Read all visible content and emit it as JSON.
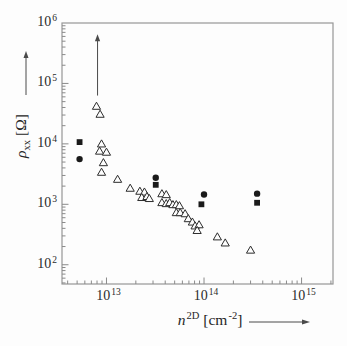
{
  "labels": {
    "ten": "10",
    "y_title_symbol": "ρ",
    "y_title_sub": "xx",
    "y_title_unit": "[Ω]",
    "x_title_symbol": "n",
    "x_title_sup": "2D",
    "x_title_unit_open": "[cm",
    "x_title_unit_exp": "-2",
    "x_title_unit_close": "]"
  },
  "y_axis": {
    "tick_exponents": [
      6,
      5,
      4,
      3,
      2
    ]
  },
  "x_axis": {
    "tick_exponents": [
      13,
      14,
      15
    ]
  },
  "colors": {
    "background": "#fdfdfd",
    "frame": "#979797",
    "tick": "#8a8a8a",
    "marker": "#1a1a1a",
    "triangle_stroke": "#2c2c2c",
    "arrow": "#4a4a4a",
    "text": "#2b2b2b"
  },
  "chart_data": {
    "type": "scatter",
    "x_scale": "log",
    "y_scale": "log",
    "xlabel": "n^2D [cm^-2]",
    "ylabel": "rho_xx [Ohm]",
    "xlim": [
      3500000000000.0,
      2100000000000000.0
    ],
    "ylim": [
      48,
      1000000
    ],
    "x_major_ticks": [
      10000000000000.0,
      100000000000000.0,
      1000000000000000.0
    ],
    "y_major_ticks": [
      100,
      1000,
      10000,
      100000,
      1000000
    ],
    "grid": false,
    "legend": false,
    "series": [
      {
        "name": "open-triangles",
        "marker": "triangle-open",
        "points": [
          [
            7900000000000.0,
            42000
          ],
          [
            8600000000000.0,
            31000
          ],
          [
            8900000000000.0,
            10000
          ],
          [
            8500000000000.0,
            7600
          ],
          [
            10000000000000.0,
            7300
          ],
          [
            9300000000000.0,
            4900
          ],
          [
            8900000000000.0,
            3400
          ],
          [
            13000000000000.0,
            2600
          ],
          [
            17500000000000.0,
            1850
          ],
          [
            22000000000000.0,
            1650
          ],
          [
            24500000000000.0,
            1600
          ],
          [
            23000000000000.0,
            1300
          ],
          [
            26000000000000.0,
            1350
          ],
          [
            27500000000000.0,
            1250
          ],
          [
            37000000000000.0,
            1500
          ],
          [
            41000000000000.0,
            1450
          ],
          [
            37000000000000.0,
            1070
          ],
          [
            41000000000000.0,
            1030
          ],
          [
            44500000000000.0,
            1070
          ],
          [
            48000000000000.0,
            990
          ],
          [
            52000000000000.0,
            990
          ],
          [
            56000000000000.0,
            950
          ],
          [
            52000000000000.0,
            730
          ],
          [
            57000000000000.0,
            730
          ],
          [
            64000000000000.0,
            700
          ],
          [
            69000000000000.0,
            580
          ],
          [
            76000000000000.0,
            510
          ],
          [
            81000000000000.0,
            440
          ],
          [
            89000000000000.0,
            460
          ],
          [
            85000000000000.0,
            370
          ],
          [
            137000000000000.0,
            290
          ],
          [
            165000000000000.0,
            230
          ],
          [
            300000000000000.0,
            175
          ]
        ]
      },
      {
        "name": "filled-circles",
        "marker": "circle-filled",
        "points": [
          [
            5300000000000.0,
            5600
          ],
          [
            32000000000000.0,
            2750
          ],
          [
            100000000000000.0,
            1450
          ],
          [
            350000000000000.0,
            1500
          ]
        ]
      },
      {
        "name": "filled-squares",
        "marker": "square-filled",
        "points": [
          [
            5300000000000.0,
            10700
          ],
          [
            32000000000000.0,
            2100
          ],
          [
            94000000000000.0,
            1000
          ],
          [
            350000000000000.0,
            1060
          ]
        ]
      }
    ],
    "annotation": {
      "type": "arrow-up",
      "n": 8100000000000.0,
      "rho_from": 63000,
      "rho_to": 560000
    }
  }
}
